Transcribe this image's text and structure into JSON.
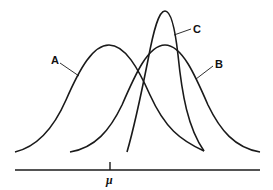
{
  "diagram": {
    "curves": [
      {
        "id": "A",
        "label": "A",
        "shape": "symmetric, wide, centered at mu"
      },
      {
        "id": "B",
        "label": "B",
        "shape": "symmetric, wide, shifted right of mu"
      },
      {
        "id": "C",
        "label": "C",
        "shape": "narrow, tall, skewed, shifted right of mu"
      }
    ],
    "axis": {
      "tick_label": "μ"
    },
    "colors": {
      "stroke": "#1a1a1a",
      "background": "#ffffff"
    }
  }
}
